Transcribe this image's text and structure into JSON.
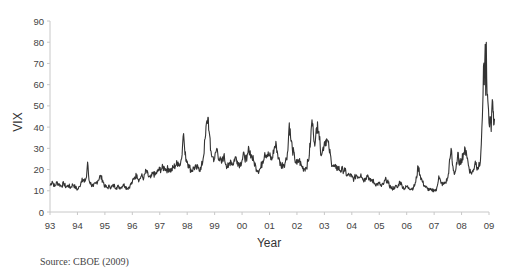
{
  "chart_data": {
    "type": "line",
    "title": "",
    "xlabel": "Year",
    "ylabel": "VIX",
    "ylim": [
      0,
      90
    ],
    "yticks": [
      0,
      10,
      20,
      30,
      40,
      50,
      60,
      70,
      80,
      90
    ],
    "xticks": [
      "93",
      "94",
      "95",
      "96",
      "97",
      "98",
      "99",
      "00",
      "01",
      "02",
      "03",
      "04",
      "05",
      "06",
      "07",
      "08",
      "09"
    ],
    "grid": false,
    "legend": null,
    "series": [
      {
        "name": "VIX",
        "color": "#333333",
        "points": [
          [
            1993.0,
            12.5
          ],
          [
            1993.08,
            14.5
          ],
          [
            1993.17,
            12.0
          ],
          [
            1993.25,
            14.0
          ],
          [
            1993.33,
            13.0
          ],
          [
            1993.42,
            12.2
          ],
          [
            1993.5,
            13.5
          ],
          [
            1993.58,
            11.8
          ],
          [
            1993.67,
            12.5
          ],
          [
            1993.75,
            11.5
          ],
          [
            1993.83,
            13.0
          ],
          [
            1993.92,
            11.8
          ],
          [
            1994.0,
            10.5
          ],
          [
            1994.08,
            12.0
          ],
          [
            1994.17,
            16.0
          ],
          [
            1994.25,
            14.0
          ],
          [
            1994.33,
            16.5
          ],
          [
            1994.37,
            23.5
          ],
          [
            1994.42,
            15.0
          ],
          [
            1994.5,
            13.0
          ],
          [
            1994.58,
            12.0
          ],
          [
            1994.67,
            13.5
          ],
          [
            1994.75,
            15.0
          ],
          [
            1994.83,
            17.0
          ],
          [
            1994.92,
            15.0
          ],
          [
            1995.0,
            12.0
          ],
          [
            1995.08,
            11.5
          ],
          [
            1995.17,
            12.0
          ],
          [
            1995.25,
            11.8
          ],
          [
            1995.33,
            12.5
          ],
          [
            1995.42,
            11.5
          ],
          [
            1995.5,
            12.0
          ],
          [
            1995.58,
            11.5
          ],
          [
            1995.67,
            13.0
          ],
          [
            1995.75,
            12.0
          ],
          [
            1995.83,
            11.2
          ],
          [
            1995.92,
            12.5
          ],
          [
            1996.0,
            14.0
          ],
          [
            1996.08,
            16.5
          ],
          [
            1996.17,
            17.5
          ],
          [
            1996.25,
            15.0
          ],
          [
            1996.33,
            17.0
          ],
          [
            1996.42,
            16.0
          ],
          [
            1996.5,
            19.5
          ],
          [
            1996.58,
            17.0
          ],
          [
            1996.67,
            16.0
          ],
          [
            1996.75,
            18.0
          ],
          [
            1996.83,
            17.5
          ],
          [
            1996.92,
            19.0
          ],
          [
            1997.0,
            20.0
          ],
          [
            1997.08,
            20.5
          ],
          [
            1997.17,
            21.0
          ],
          [
            1997.25,
            20.0
          ],
          [
            1997.33,
            20.5
          ],
          [
            1997.42,
            19.5
          ],
          [
            1997.5,
            21.0
          ],
          [
            1997.58,
            22.0
          ],
          [
            1997.67,
            23.5
          ],
          [
            1997.75,
            22.0
          ],
          [
            1997.83,
            31.0
          ],
          [
            1997.87,
            37.0
          ],
          [
            1997.92,
            27.0
          ],
          [
            1998.0,
            24.0
          ],
          [
            1998.08,
            21.0
          ],
          [
            1998.17,
            19.5
          ],
          [
            1998.25,
            21.0
          ],
          [
            1998.33,
            20.5
          ],
          [
            1998.42,
            21.0
          ],
          [
            1998.5,
            20.0
          ],
          [
            1998.58,
            25.0
          ],
          [
            1998.67,
            36.0
          ],
          [
            1998.72,
            43.0
          ],
          [
            1998.77,
            44.5
          ],
          [
            1998.8,
            38.0
          ],
          [
            1998.85,
            29.0
          ],
          [
            1998.92,
            26.0
          ],
          [
            1999.0,
            25.0
          ],
          [
            1999.08,
            30.0
          ],
          [
            1999.17,
            25.0
          ],
          [
            1999.25,
            23.0
          ],
          [
            1999.33,
            26.5
          ],
          [
            1999.42,
            22.5
          ],
          [
            1999.5,
            21.0
          ],
          [
            1999.58,
            24.5
          ],
          [
            1999.67,
            22.5
          ],
          [
            1999.75,
            26.0
          ],
          [
            1999.83,
            24.0
          ],
          [
            1999.92,
            22.5
          ],
          [
            2000.0,
            24.5
          ],
          [
            2000.08,
            27.0
          ],
          [
            2000.17,
            24.0
          ],
          [
            2000.25,
            30.0
          ],
          [
            2000.33,
            27.0
          ],
          [
            2000.42,
            24.0
          ],
          [
            2000.5,
            21.5
          ],
          [
            2000.58,
            19.5
          ],
          [
            2000.67,
            20.5
          ],
          [
            2000.75,
            24.0
          ],
          [
            2000.83,
            28.0
          ],
          [
            2000.92,
            27.0
          ],
          [
            2001.0,
            26.5
          ],
          [
            2001.08,
            24.5
          ],
          [
            2001.17,
            30.0
          ],
          [
            2001.25,
            31.5
          ],
          [
            2001.33,
            25.0
          ],
          [
            2001.42,
            22.0
          ],
          [
            2001.5,
            22.5
          ],
          [
            2001.58,
            23.5
          ],
          [
            2001.67,
            29.0
          ],
          [
            2001.72,
            42.0
          ],
          [
            2001.77,
            35.0
          ],
          [
            2001.83,
            30.0
          ],
          [
            2001.92,
            25.0
          ],
          [
            2002.0,
            22.5
          ],
          [
            2002.08,
            24.5
          ],
          [
            2002.17,
            21.5
          ],
          [
            2002.25,
            20.5
          ],
          [
            2002.33,
            21.0
          ],
          [
            2002.42,
            24.0
          ],
          [
            2002.5,
            34.0
          ],
          [
            2002.55,
            43.5
          ],
          [
            2002.6,
            37.0
          ],
          [
            2002.67,
            33.0
          ],
          [
            2002.75,
            42.5
          ],
          [
            2002.8,
            38.0
          ],
          [
            2002.85,
            30.0
          ],
          [
            2002.92,
            28.0
          ],
          [
            2003.0,
            33.0
          ],
          [
            2003.08,
            34.5
          ],
          [
            2003.17,
            30.0
          ],
          [
            2003.25,
            24.0
          ],
          [
            2003.33,
            21.5
          ],
          [
            2003.42,
            20.5
          ],
          [
            2003.5,
            21.0
          ],
          [
            2003.58,
            19.5
          ],
          [
            2003.67,
            20.0
          ],
          [
            2003.75,
            19.5
          ],
          [
            2003.83,
            17.0
          ],
          [
            2003.92,
            17.5
          ],
          [
            2004.0,
            16.5
          ],
          [
            2004.08,
            15.5
          ],
          [
            2004.17,
            17.5
          ],
          [
            2004.25,
            16.5
          ],
          [
            2004.33,
            18.0
          ],
          [
            2004.42,
            15.0
          ],
          [
            2004.5,
            16.0
          ],
          [
            2004.58,
            17.5
          ],
          [
            2004.67,
            14.5
          ],
          [
            2004.75,
            15.0
          ],
          [
            2004.83,
            13.5
          ],
          [
            2004.92,
            13.0
          ],
          [
            2005.0,
            13.5
          ],
          [
            2005.08,
            12.0
          ],
          [
            2005.17,
            13.5
          ],
          [
            2005.25,
            15.5
          ],
          [
            2005.33,
            13.5
          ],
          [
            2005.42,
            11.5
          ],
          [
            2005.5,
            11.0
          ],
          [
            2005.58,
            12.0
          ],
          [
            2005.67,
            11.5
          ],
          [
            2005.75,
            14.5
          ],
          [
            2005.83,
            12.5
          ],
          [
            2005.92,
            11.0
          ],
          [
            2006.0,
            12.0
          ],
          [
            2006.08,
            11.5
          ],
          [
            2006.17,
            11.0
          ],
          [
            2006.25,
            11.5
          ],
          [
            2006.33,
            14.0
          ],
          [
            2006.42,
            21.5
          ],
          [
            2006.5,
            17.0
          ],
          [
            2006.58,
            14.0
          ],
          [
            2006.67,
            12.0
          ],
          [
            2006.75,
            11.0
          ],
          [
            2006.83,
            10.5
          ],
          [
            2006.92,
            10.0
          ],
          [
            2007.0,
            10.5
          ],
          [
            2007.08,
            10.0
          ],
          [
            2007.17,
            17.0
          ],
          [
            2007.25,
            13.5
          ],
          [
            2007.33,
            13.0
          ],
          [
            2007.42,
            14.0
          ],
          [
            2007.5,
            16.0
          ],
          [
            2007.58,
            25.0
          ],
          [
            2007.62,
            30.0
          ],
          [
            2007.67,
            22.0
          ],
          [
            2007.75,
            18.0
          ],
          [
            2007.83,
            22.5
          ],
          [
            2007.88,
            28.0
          ],
          [
            2007.92,
            22.0
          ],
          [
            2008.0,
            25.0
          ],
          [
            2008.08,
            28.0
          ],
          [
            2008.17,
            29.0
          ],
          [
            2008.25,
            22.0
          ],
          [
            2008.33,
            18.5
          ],
          [
            2008.42,
            19.0
          ],
          [
            2008.5,
            24.0
          ],
          [
            2008.58,
            21.0
          ],
          [
            2008.67,
            22.0
          ],
          [
            2008.72,
            32.0
          ],
          [
            2008.76,
            45.0
          ],
          [
            2008.8,
            69.0
          ],
          [
            2008.83,
            60.0
          ],
          [
            2008.86,
            79.0
          ],
          [
            2008.88,
            55.0
          ],
          [
            2008.9,
            80.0
          ],
          [
            2008.93,
            55.0
          ],
          [
            2008.96,
            52.0
          ],
          [
            2009.0,
            42.0
          ],
          [
            2009.04,
            45.0
          ],
          [
            2009.08,
            38.0
          ],
          [
            2009.12,
            53.0
          ],
          [
            2009.15,
            47.0
          ],
          [
            2009.17,
            41.0
          ],
          [
            2009.2,
            44.0
          ]
        ]
      }
    ],
    "annotations": [
      "Source: CBOE (2009)"
    ]
  },
  "labels": {
    "xlabel": "Year",
    "ylabel": "VIX",
    "source": "Source: CBOE (2009)"
  }
}
